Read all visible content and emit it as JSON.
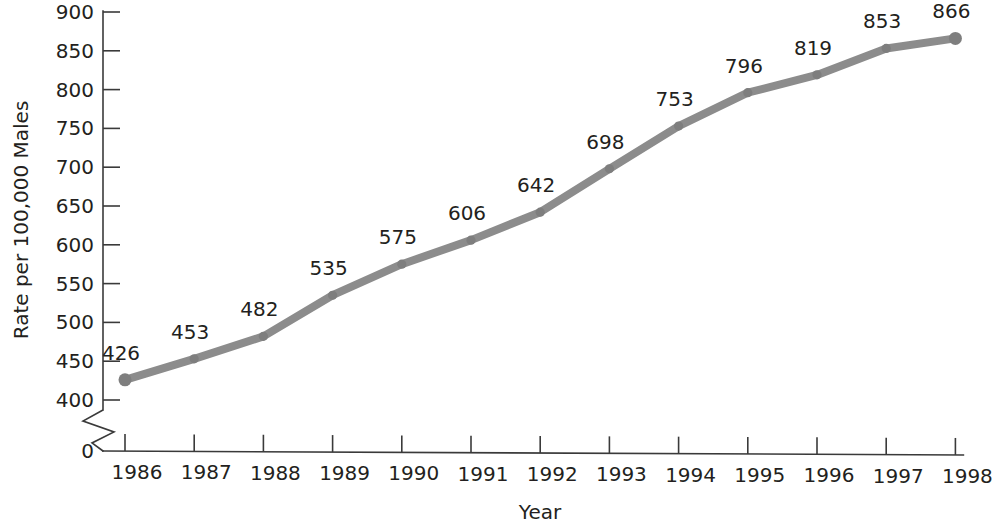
{
  "chart_data": {
    "type": "line",
    "title": "",
    "xlabel": "Year",
    "ylabel": "Rate per 100,000 Males",
    "categories": [
      "1986",
      "1987",
      "1988",
      "1989",
      "1990",
      "1991",
      "1992",
      "1993",
      "1994",
      "1995",
      "1996",
      "1997",
      "1998"
    ],
    "x": [
      1986,
      1987,
      1988,
      1989,
      1990,
      1991,
      1992,
      1993,
      1994,
      1995,
      1996,
      1997,
      1998
    ],
    "values": [
      426,
      453,
      482,
      535,
      575,
      606,
      642,
      698,
      753,
      796,
      819,
      853,
      866
    ],
    "point_labels": [
      "426",
      "453",
      "482",
      "535",
      "575",
      "606",
      "642",
      "698",
      "753",
      "796",
      "819",
      "853",
      "866"
    ],
    "ylim": [
      400,
      900
    ],
    "ytick_values": [
      400,
      450,
      500,
      550,
      600,
      650,
      700,
      750,
      800,
      850,
      900
    ],
    "ytick_labels": [
      "400",
      "450",
      "500",
      "550",
      "600",
      "650",
      "700",
      "750",
      "800",
      "850",
      "900"
    ],
    "y_origin_label": "0",
    "axis_break": true,
    "grid": false,
    "legend": "none",
    "series_color": "#8c8c8c",
    "axis_color": "#3a3a3a",
    "text_color": "#231f20",
    "marker": "circle"
  }
}
